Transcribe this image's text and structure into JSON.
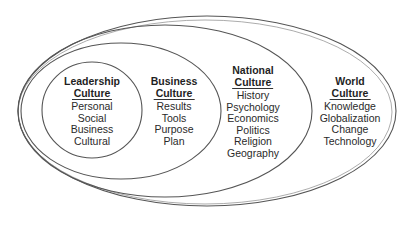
{
  "diagram": {
    "type": "nested-ellipses",
    "title": "",
    "layers": [
      {
        "id": "world",
        "title_line1": "World",
        "title_line2": "Culture",
        "items": [
          "Knowledge",
          "Globalization",
          "Change",
          "Technology"
        ]
      },
      {
        "id": "national",
        "title_line1": "National",
        "title_line2": "Culture",
        "items": [
          "History",
          "Psychology",
          "Economics",
          "Politics",
          "Religion",
          "Geography"
        ]
      },
      {
        "id": "business",
        "title_line1": "Business",
        "title_line2": "Culture",
        "items": [
          "Results",
          "Tools",
          "Purpose",
          "Plan"
        ]
      },
      {
        "id": "leadership",
        "title_line1": "Leadership",
        "title_line2": "Culture",
        "items": [
          "Personal",
          "Social",
          "Business",
          "Cultural"
        ]
      }
    ],
    "colors": {
      "stroke": "#555555",
      "text": "#2a2a2a",
      "background": "#ffffff"
    }
  }
}
